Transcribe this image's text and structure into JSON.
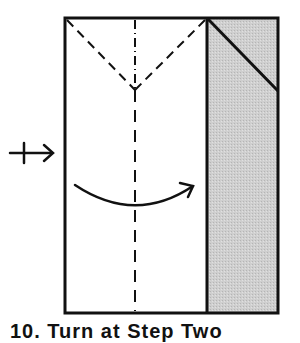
{
  "diagram": {
    "caption": "10. Turn at Step Two",
    "colors": {
      "line": "#111111",
      "paper": "#ffffff",
      "flap_fill": "#c8c8c8"
    },
    "elements": [
      {
        "name": "paper-outline",
        "type": "rect"
      },
      {
        "name": "folded-flap",
        "type": "shaded-rect",
        "note": "gray strip on right with diagonal crease"
      },
      {
        "name": "valley-fold-v",
        "type": "dashed-lines",
        "note": "V-shape from top corners to center"
      },
      {
        "name": "center-crease",
        "type": "dash-dot / dashed vertical line"
      },
      {
        "name": "fold-over-arrow",
        "type": "curved arrow left to right"
      },
      {
        "name": "turn-over-symbol",
        "type": "arrow with tick, left side"
      }
    ]
  }
}
